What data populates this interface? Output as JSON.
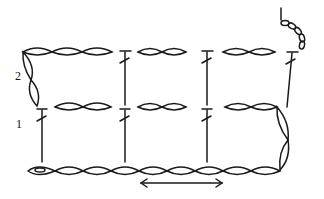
{
  "diagram": {
    "type": "crochet-stitch-chart",
    "row_labels": [
      {
        "label": "2",
        "x": 15,
        "y": 70
      },
      {
        "label": "1",
        "x": 15,
        "y": 118
      }
    ],
    "stroke_color": "#1a1a1a",
    "background": "#ffffff",
    "rows": [
      {
        "row": "foundation",
        "stitches": "chain",
        "count": 10
      },
      {
        "row": "1",
        "stitches": "treble crochet with 2 chains between",
        "trebles": 3
      },
      {
        "row": "2",
        "stitches": "treble crochet with 2 chains between",
        "trebles": 3
      }
    ],
    "direction_arrow": "double-headed horizontal arrow under foundation chain"
  }
}
